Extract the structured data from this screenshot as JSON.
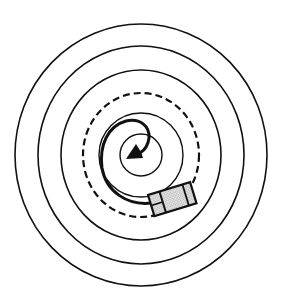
{
  "figure": {
    "colors": {
      "background": "#ffffff",
      "stroke": "#111111",
      "robot_fill": "#c8c8c8"
    },
    "center": [
      141,
      155
    ],
    "rings": [
      {
        "rx": 126,
        "ry": 131,
        "style": "solid"
      },
      {
        "rx": 103,
        "ry": 109,
        "style": "solid"
      },
      {
        "rx": 80,
        "ry": 85,
        "style": "solid"
      },
      {
        "rx": 58,
        "ry": 62,
        "style": "dashed"
      }
    ],
    "inner_circles": [
      {
        "r": 42,
        "style": "solid"
      },
      {
        "r": 21,
        "style": "solid"
      }
    ],
    "spiral_path": {
      "style": "thick",
      "ends_with": "arrowhead"
    },
    "robot": {
      "x": 148,
      "y": 195,
      "width": 44,
      "height": 22,
      "angle_deg": -17
    }
  }
}
